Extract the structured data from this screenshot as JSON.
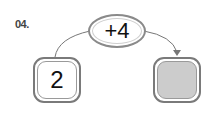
{
  "problem": {
    "number": "04."
  },
  "diagram": {
    "operator": "+4",
    "start_value": "2",
    "result_value": "",
    "result_fill_color": "#cccccc",
    "border_color": "#7a7a7a"
  }
}
